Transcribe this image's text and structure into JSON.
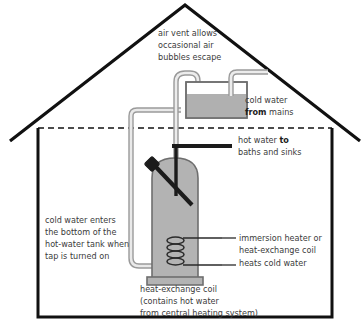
{
  "diagram": {
    "colors": {
      "outline": "#111111",
      "text": "#3b3b3b",
      "tank_fill": "#b3b3b3",
      "tank_stroke": "#6e6e6e",
      "water_fill": "#b0b0b0",
      "pipe_stroke": "#9a9a9a",
      "pipe_fill": "#e8e8e8",
      "dark_pipe": "#1b1b1b",
      "background": "#ffffff"
    },
    "labels": {
      "air_vent": {
        "lines": [
          "air vent allows",
          "occasional air",
          "bubbles escape"
        ]
      },
      "cold_water_mains": {
        "line1": "cold water",
        "line2_bold": "from",
        "line2_rest": " mains"
      },
      "hot_water_out": {
        "line1_rest": "hot water ",
        "line1_bold": "to",
        "line2": "baths and sinks"
      },
      "cold_water_in": {
        "lines": [
          "cold water enters",
          "the bottom of the",
          "hot-water tank when",
          "tap is turned on"
        ]
      },
      "immersion_heater": {
        "lines": [
          "immersion heater or",
          "heat-exchange coil",
          "heats cold water"
        ]
      },
      "heat_exchange_caption": {
        "lines": [
          "heat-exchange coil",
          "(contains hot water",
          "from central heating system)"
        ]
      }
    },
    "parts": {
      "house": "house-outline",
      "roof": "roof",
      "ceiling": "ceiling-dashed-line",
      "cistern": "cold-water-cistern",
      "cistern_water": "cistern-water-level",
      "vent_pipe": "air-vent-pipe",
      "mains_inlet": "mains-inlet-pipe",
      "cold_feed": "cold-feed-pipe",
      "hot_tank": "hot-water-tank",
      "vent_riser": "vent-riser-pipe",
      "hot_outlet": "hot-water-outlet-pipe",
      "immersion": "immersion-heater-rod",
      "coil": "heat-exchange-coil"
    }
  }
}
